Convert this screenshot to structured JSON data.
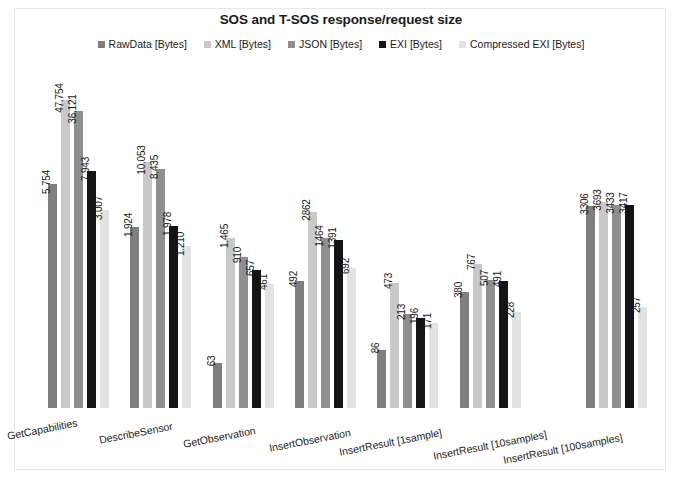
{
  "chart_data": {
    "type": "bar",
    "title": "SOS and T-SOS response/request size",
    "xlabel": "",
    "ylabel": "",
    "grid": false,
    "legend_position": "top-center",
    "scale": "log",
    "categories": [
      "GetCapabilities",
      "DescribeSensor",
      "GetObservation",
      "InsertObservation",
      "InsertResult [1sample]",
      "InsertResult [10samples]",
      "InsertResult [100samples]"
    ],
    "series": [
      {
        "name": "RawData [Bytes]",
        "color": "#7f7f7f",
        "values": [
          5754,
          1924,
          63,
          492,
          86,
          380,
          3306
        ],
        "labels": [
          "5.754",
          "1.924",
          "63",
          "492",
          "86",
          "380",
          "3306"
        ]
      },
      {
        "name": "XML [Bytes]",
        "color": "#c9c9c9",
        "values": [
          47754,
          10053,
          1465,
          2862,
          473,
          767,
          3693
        ],
        "labels": [
          "47.754",
          "10.053",
          "1.465",
          "2862",
          "473",
          "767",
          "3693"
        ]
      },
      {
        "name": "JSON [Bytes]",
        "color": "#8f8f8f",
        "values": [
          36121,
          8435,
          910,
          1464,
          213,
          507,
          3433
        ],
        "labels": [
          "36.121",
          "8.435",
          "910",
          "1464",
          "213",
          "507",
          "3433"
        ]
      },
      {
        "name": "EXI [Bytes]",
        "color": "#141414",
        "values": [
          7943,
          1978,
          657,
          1391,
          196,
          491,
          3417
        ],
        "labels": [
          "7.943",
          "1.978",
          "657",
          "1391",
          "196",
          "491",
          "3417"
        ]
      },
      {
        "name": "Compressed EXI [Bytes]",
        "color": "#e2e2e2",
        "values": [
          3007,
          1210,
          461,
          692,
          171,
          228,
          257
        ],
        "labels": [
          "3.007",
          "1.210",
          "461",
          "692",
          "171",
          "228",
          "257"
        ]
      }
    ]
  }
}
